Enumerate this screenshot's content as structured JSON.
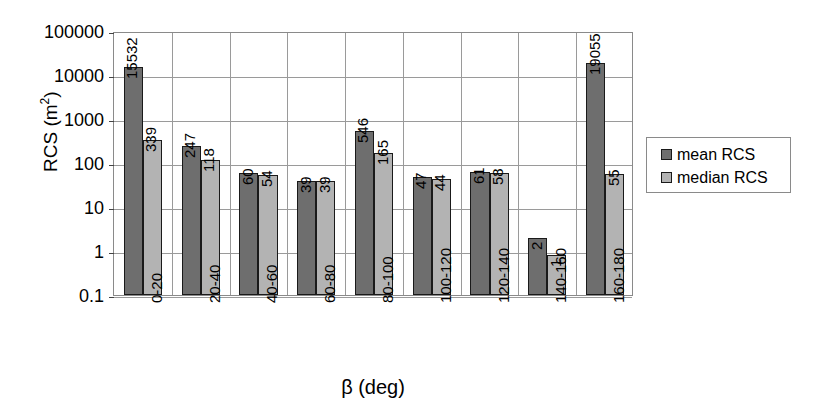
{
  "chart_data": {
    "type": "bar",
    "title": "",
    "xlabel": "β (deg)",
    "ylabel": "RCS (m²)",
    "ylabel_base": "RCS (m",
    "ylabel_sup": "2",
    "ylabel_tail": ")",
    "yscale": "log",
    "ylim": [
      0.1,
      100000
    ],
    "ytick_labels": [
      "100000",
      "10000",
      "1000",
      "100",
      "10",
      "1",
      "0.1"
    ],
    "ytick_values": [
      100000,
      10000,
      1000,
      100,
      10,
      1,
      0.1
    ],
    "grid": true,
    "legend_position": "right",
    "categories": [
      "0-20",
      "20-40",
      "40-60",
      "60-80",
      "80-100",
      "100-120",
      "120-140",
      "140-160",
      "160-180"
    ],
    "series": [
      {
        "name": "mean RCS",
        "color": "#6e6e6e",
        "values": [
          15532,
          247,
          60,
          39,
          546,
          47,
          61,
          2,
          19055
        ],
        "labels": [
          "15532",
          "247",
          "60",
          "39",
          "546",
          "47",
          "61",
          "2",
          "19055"
        ]
      },
      {
        "name": "median RCS",
        "color": "#b3b3b3",
        "values": [
          339,
          118,
          54,
          39,
          165,
          44,
          58,
          0.8,
          55
        ],
        "labels": [
          "339",
          "118",
          "54",
          "39",
          "165",
          "44",
          "58",
          "1",
          "55"
        ]
      }
    ]
  },
  "legend": {
    "entries": [
      {
        "label": "mean RCS",
        "swatch_class": "mean"
      },
      {
        "label": "median RCS",
        "swatch_class": "median"
      }
    ]
  },
  "colors": {
    "mean_bar": "#6e6e6e",
    "median_bar": "#b3b3b3",
    "gridline": "#9a9a9a",
    "axis": "#8a8a8a",
    "background": "#ffffff",
    "text": "#000000"
  }
}
